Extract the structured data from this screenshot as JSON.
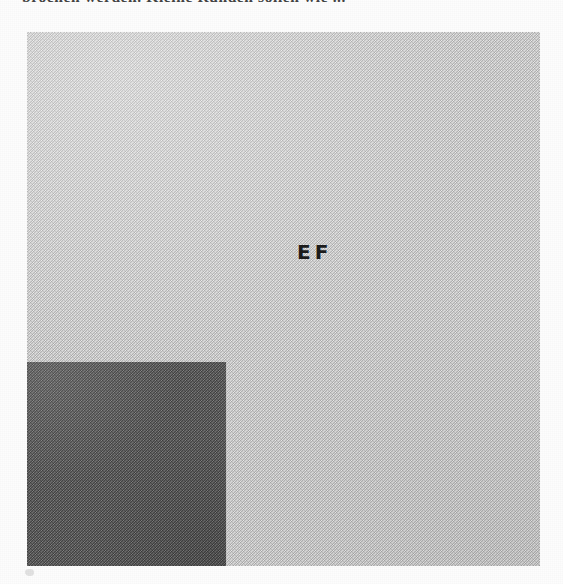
{
  "page": {
    "width": 563,
    "height": 584,
    "background_color": "#fdfdfd"
  },
  "caption": {
    "top_text": "brochen werden. Kleine Runden sollen wie ..."
  },
  "figure": {
    "label": "EF",
    "plate": {
      "name": "light-grey-plate",
      "fill_color": "#c9c9c9",
      "x": 27,
      "y": 32,
      "width": 513,
      "height": 534,
      "texture": "halftone-dither"
    },
    "dark_square": {
      "name": "dark-grey-quadrant",
      "fill_color": "#565656",
      "x": 27,
      "y": 362,
      "width": 199,
      "height": 204,
      "texture": "halftone-dither",
      "position": "lower-left"
    },
    "speck": {
      "name": "scan-artifact-speck",
      "color": "#d8d8d8"
    }
  }
}
